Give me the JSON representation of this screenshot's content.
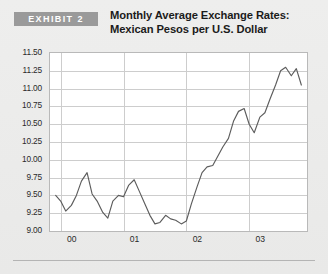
{
  "header": {
    "badge_label": "EXHIBIT 2",
    "title_line1": "Monthly Average Exchange Rates:",
    "title_line2": "Mexican Pesos per U.S. Dollar"
  },
  "colors": {
    "badge_background": "#9a9a9a",
    "badge_text": "#ffffff",
    "page_background": "#ebebea",
    "plot_background": "#ffffff",
    "gridline": "#cdcdcd",
    "plot_border": "#b9b9b9",
    "series_line": "#5c5c5c",
    "text": "#1b1b1b"
  },
  "chart_data": {
    "type": "line",
    "title": "Monthly Average Exchange Rates: Mexican Pesos per U.S. Dollar",
    "xlabel": "",
    "ylabel": "",
    "ylim": [
      9.0,
      11.5
    ],
    "ytick_labels": [
      "11.50",
      "11.25",
      "11.00",
      "10.75",
      "10.50",
      "10.25",
      "10.00",
      "9.75",
      "9.50",
      "9.25",
      "9.00"
    ],
    "ytick_values": [
      11.5,
      11.25,
      11.0,
      10.75,
      10.5,
      10.25,
      10.0,
      9.75,
      9.5,
      9.25,
      9.0
    ],
    "xtick_labels": [
      "00",
      "01",
      "02",
      "03"
    ],
    "xtick_values": [
      2000.0,
      2001.0,
      2002.0,
      2003.0
    ],
    "xlim": [
      1999.83,
      2003.92
    ],
    "grid": true,
    "legend": "none",
    "series": [
      {
        "name": "Mexican Pesos per U.S. Dollar",
        "x": [
          1999.92,
          2000.0,
          2000.08,
          2000.17,
          2000.25,
          2000.33,
          2000.42,
          2000.5,
          2000.58,
          2000.67,
          2000.75,
          2000.83,
          2000.92,
          2001.0,
          2001.08,
          2001.17,
          2001.25,
          2001.33,
          2001.42,
          2001.5,
          2001.58,
          2001.67,
          2001.75,
          2001.83,
          2001.92,
          2002.0,
          2002.08,
          2002.17,
          2002.25,
          2002.33,
          2002.42,
          2002.5,
          2002.58,
          2002.67,
          2002.75,
          2002.83,
          2002.92,
          2003.0,
          2003.08,
          2003.17,
          2003.25,
          2003.33,
          2003.42,
          2003.5,
          2003.58,
          2003.67,
          2003.75,
          2003.83
        ],
        "values": [
          9.5,
          9.42,
          9.28,
          9.36,
          9.5,
          9.7,
          9.82,
          9.52,
          9.42,
          9.26,
          9.18,
          9.42,
          9.5,
          9.48,
          9.64,
          9.72,
          9.56,
          9.4,
          9.22,
          9.1,
          9.12,
          9.22,
          9.17,
          9.15,
          9.1,
          9.14,
          9.38,
          9.62,
          9.82,
          9.9,
          9.92,
          10.05,
          10.18,
          10.3,
          10.54,
          10.68,
          10.72,
          10.5,
          10.38,
          10.6,
          10.66,
          10.85,
          11.05,
          11.25,
          11.3,
          11.18,
          11.28,
          11.05
        ]
      }
    ]
  }
}
